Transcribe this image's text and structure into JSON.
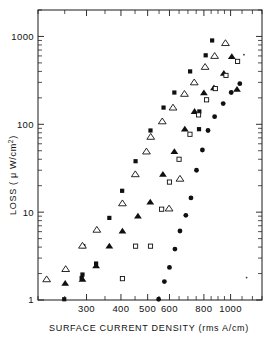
{
  "figure": {
    "background_color": "#ffffff",
    "ink_color": "#101010"
  },
  "axes": {
    "x": {
      "label": "SURFACE CURRENT DENSITY (rms A/cm)",
      "scale": "log",
      "min": 200,
      "max": 1300,
      "tick_labels": [
        "300",
        "400",
        "500",
        "600",
        "800",
        "1000"
      ],
      "tick_values": [
        300,
        400,
        500,
        600,
        800,
        1000
      ],
      "minor_ticks": [
        200,
        250,
        350,
        450,
        550,
        650,
        700,
        750,
        850,
        900,
        950,
        1100,
        1200,
        1300
      ]
    },
    "y": {
      "label": "LOSS ( μ W/cm",
      "label_exponent": "2",
      "label_suffix": ")",
      "label_full": "LOSS ( μ W/cm² )",
      "scale": "log",
      "min": 1,
      "max": 2000,
      "tick_labels": [
        "1000",
        "100",
        "10",
        "1"
      ],
      "tick_values": [
        1000,
        100,
        10,
        1
      ]
    }
  },
  "chart_data": {
    "type": "scatter",
    "title": "",
    "xlabel": "SURFACE CURRENT DENSITY (rms A/cm)",
    "ylabel": "LOSS ( μ W/cm² )",
    "xscale": "log",
    "yscale": "log",
    "xlim": [
      200,
      1300
    ],
    "ylim": [
      1,
      2000
    ],
    "grid": false,
    "legend": "none",
    "series": [
      {
        "name": "filled-square",
        "marker": "square",
        "filled": true,
        "points": [
          [
            249,
            1.02
          ],
          [
            288,
            1.78
          ],
          [
            290,
            1.95
          ],
          [
            292,
            4.1
          ],
          [
            325,
            2.6
          ],
          [
            363,
            8.6
          ],
          [
            404,
            17.5
          ],
          [
            452,
            38
          ],
          [
            512,
            85
          ],
          [
            571,
            155
          ],
          [
            625,
            230
          ],
          [
            713,
            400
          ],
          [
            768,
            88
          ],
          [
            770,
            140
          ],
          [
            812,
            610
          ],
          [
            857,
            900
          ]
        ]
      },
      {
        "name": "open-triangle",
        "marker": "triangle",
        "filled": false,
        "points": [
          [
            215,
            1.72
          ],
          [
            252,
            2.25
          ],
          [
            290,
            4.15
          ],
          [
            327,
            6.3
          ],
          [
            405,
            12.6
          ],
          [
            451,
            27
          ],
          [
            495,
            49
          ],
          [
            513,
            72
          ],
          [
            565,
            108
          ],
          [
            618,
            155
          ],
          [
            680,
            222
          ],
          [
            738,
            300
          ],
          [
            808,
            450
          ],
          [
            875,
            600
          ],
          [
            958,
            840
          ],
          [
            655,
            24
          ],
          [
            598,
            11
          ]
        ]
      },
      {
        "name": "filled-triangle",
        "marker": "triangle",
        "filled": true,
        "points": [
          [
            251,
            1.55
          ],
          [
            290,
            1.72
          ],
          [
            325,
            2.45
          ],
          [
            363,
            4.1
          ],
          [
            405,
            6.1
          ],
          [
            461,
            9.0
          ],
          [
            511,
            13.0
          ],
          [
            568,
            27
          ],
          [
            625,
            49
          ],
          [
            682,
            88
          ],
          [
            740,
            140
          ],
          [
            800,
            228
          ],
          [
            870,
            260
          ],
          [
            945,
            380
          ],
          [
            1010,
            590
          ],
          [
            1055,
            250
          ]
        ]
      },
      {
        "name": "open-square",
        "marker": "square",
        "filled": false,
        "points": [
          [
            405,
            1.75
          ],
          [
            452,
            4.1
          ],
          [
            512,
            4.1
          ],
          [
            562,
            10.8
          ],
          [
            600,
            22
          ],
          [
            650,
            40
          ],
          [
            712,
            77
          ],
          [
            765,
            128
          ],
          [
            818,
            190
          ],
          [
            880,
            255
          ],
          [
            962,
            360
          ],
          [
            1060,
            520
          ]
        ]
      },
      {
        "name": "filled-circle",
        "marker": "circle",
        "filled": true,
        "points": [
          [
            548,
            1.02
          ],
          [
            575,
            1.62
          ],
          [
            600,
            2.35
          ],
          [
            628,
            3.8
          ],
          [
            655,
            6.1
          ],
          [
            688,
            9.2
          ],
          [
            718,
            14.5
          ],
          [
            752,
            30
          ],
          [
            790,
            51
          ],
          [
            828,
            85
          ],
          [
            875,
            122
          ],
          [
            940,
            172
          ],
          [
            1005,
            230
          ],
          [
            1080,
            290
          ]
        ]
      },
      {
        "name": "stray-marks",
        "marker": "dot",
        "filled": true,
        "points": [
          [
            1143,
            1.8
          ],
          [
            1118,
            620
          ]
        ]
      }
    ]
  }
}
